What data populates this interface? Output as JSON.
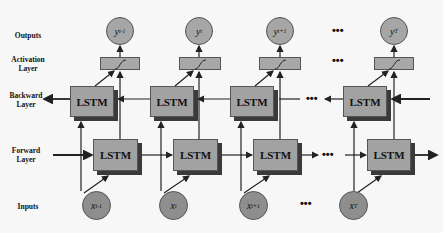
{
  "diagram": {
    "type": "bidirectional-lstm",
    "row_labels": {
      "outputs": "Outputs",
      "activation": "Activation Layer",
      "activation_line1": "Activation",
      "activation_line2": "Layer",
      "backward": "Backward Layer",
      "backward_line1": "Backward",
      "backward_line2": "Layer",
      "forward": "Forward Layer",
      "forward_line1": "Forward",
      "forward_line2": "Layer",
      "inputs": "Inputs"
    },
    "outputs": [
      {
        "base": "y",
        "sub": "t-1"
      },
      {
        "base": "y",
        "sub": "t"
      },
      {
        "base": "y",
        "sub": "t+1"
      },
      {
        "base": "y",
        "sub": "T"
      }
    ],
    "inputs": [
      {
        "base": "x",
        "sub": "t-1"
      },
      {
        "base": "x",
        "sub": "t"
      },
      {
        "base": "x",
        "sub": "t+1"
      },
      {
        "base": "x",
        "sub": "T"
      }
    ],
    "cell_label": "LSTM",
    "activation_symbol": "∫",
    "ellipsis": "•••",
    "colors": {
      "background": "#f7f7f7",
      "cell_fill": "#a2a2a2",
      "cell_shadow": "#3a3a3a",
      "output_fill": "#a6a6a6",
      "input_fill": "#8e8e8e",
      "line": "#222222"
    }
  }
}
